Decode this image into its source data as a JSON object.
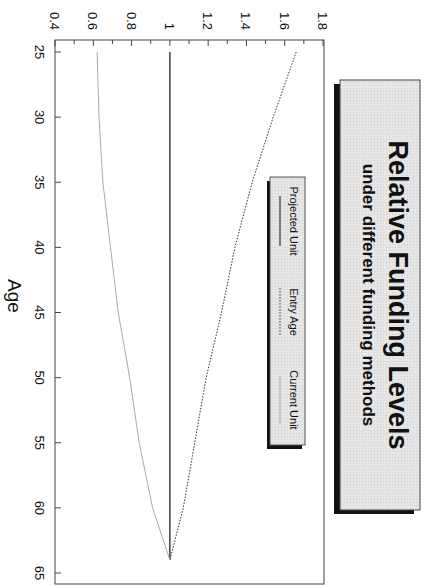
{
  "caption": "Relative funding compared to projected unit",
  "chart_data": {
    "type": "line",
    "title": "Relative Funding Levels",
    "subtitle": "under different funding methods",
    "xlabel": "Age",
    "ylabel": "",
    "xlim": [
      24,
      66
    ],
    "ylim": [
      0.4,
      1.8
    ],
    "x_ticks": [
      25,
      30,
      35,
      40,
      45,
      50,
      55,
      60,
      65
    ],
    "y_ticks": [
      0.4,
      0.6,
      0.8,
      1,
      1.2,
      1.4,
      1.6,
      1.8
    ],
    "y_tick_labels": [
      "0.4",
      "0.6",
      "0.8",
      "1",
      "1.2",
      "1.4",
      "1.6",
      "1.8"
    ],
    "grid": false,
    "orientation": "rotated 90° clockwise",
    "legend_position": "upper center (inside plot)",
    "x": [
      25,
      30,
      35,
      40,
      45,
      50,
      55,
      60,
      64
    ],
    "series": [
      {
        "name": "Projected Unit",
        "style": "solid",
        "color": "#111111",
        "values": [
          1,
          1,
          1,
          1,
          1,
          1,
          1,
          1,
          1
        ]
      },
      {
        "name": "Entry Age",
        "style": "dotted",
        "color": "#333333",
        "values": [
          1.66,
          1.54,
          1.43,
          1.34,
          1.27,
          1.19,
          1.13,
          1.07,
          1.0
        ]
      },
      {
        "name": "Current Unit",
        "style": "solid-light",
        "color": "#aaaaaa",
        "values": [
          0.62,
          0.63,
          0.65,
          0.69,
          0.73,
          0.79,
          0.84,
          0.91,
          1.0
        ]
      }
    ]
  },
  "legend": {
    "items": [
      {
        "label": "Projected Unit"
      },
      {
        "label": "Entry Age"
      },
      {
        "label": "Current Unit"
      }
    ]
  },
  "colors": {
    "box_fill": "#e4e4e4",
    "shadow": "#111111",
    "frame": "#444444"
  }
}
